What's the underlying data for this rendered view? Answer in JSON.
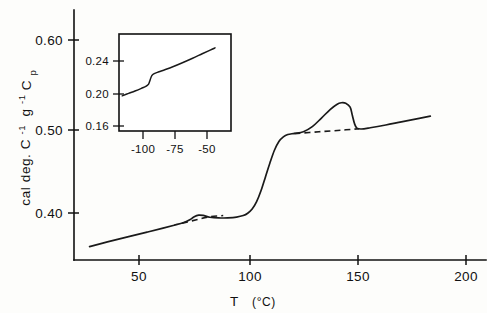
{
  "chart_data": {
    "type": "line",
    "title": "",
    "xlabel": "T  (°C)",
    "ylabel": "Cp  cal deg. C-1 g-1",
    "ylabel_parts": {
      "symbol": "C",
      "symbol_sub": "p",
      "units_a": "cal deg. C",
      "units_a_sup": "-1",
      "units_b": "g",
      "units_b_sup": "-1"
    },
    "xlabel_parts": {
      "symbol": "T",
      "units": "(°C)"
    },
    "xlim": [
      25,
      210
    ],
    "ylim": [
      0.355,
      0.625
    ],
    "grid": false,
    "legend": null,
    "xticks": [
      50,
      100,
      150,
      200
    ],
    "xtick_labels": [
      "50",
      "100",
      "150",
      "200"
    ],
    "yticks": [
      0.4,
      0.5,
      0.6
    ],
    "ytick_labels": [
      "0.40",
      "0.50",
      "0.60"
    ],
    "series": [
      {
        "name": "Cp trace",
        "style": "solid",
        "points": [
          [
            32,
            0.3695
          ],
          [
            40,
            0.3745
          ],
          [
            50,
            0.3805
          ],
          [
            58,
            0.3852
          ],
          [
            65,
            0.3895
          ],
          [
            70,
            0.3926
          ],
          [
            74,
            0.3952
          ],
          [
            77,
            0.3985
          ],
          [
            79,
            0.4018
          ],
          [
            81,
            0.4035
          ],
          [
            83,
            0.4031
          ],
          [
            86,
            0.4012
          ],
          [
            90,
            0.4004
          ],
          [
            94,
            0.4006
          ],
          [
            98,
            0.4014
          ],
          [
            101,
            0.403
          ],
          [
            103,
            0.4055
          ],
          [
            105,
            0.41
          ],
          [
            107,
            0.418
          ],
          [
            109,
            0.43
          ],
          [
            111,
            0.445
          ],
          [
            113,
            0.46
          ],
          [
            115,
            0.4735
          ],
          [
            117,
            0.483
          ],
          [
            119,
            0.488
          ],
          [
            121,
            0.4905
          ],
          [
            124,
            0.4918
          ],
          [
            128,
            0.4935
          ],
          [
            132,
            0.499
          ],
          [
            136,
            0.508
          ],
          [
            140,
            0.5175
          ],
          [
            143,
            0.523
          ],
          [
            145,
            0.5248
          ],
          [
            147,
            0.5243
          ],
          [
            149,
            0.52
          ],
          [
            150,
            0.511
          ],
          [
            151,
            0.502
          ],
          [
            152,
            0.4975
          ],
          [
            154,
            0.4965
          ],
          [
            158,
            0.4978
          ],
          [
            165,
            0.5008
          ],
          [
            172,
            0.5042
          ],
          [
            180,
            0.508
          ],
          [
            185,
            0.5103
          ]
        ]
      },
      {
        "name": "baseline under low-temperature transition",
        "style": "dashed",
        "points": [
          [
            73.5,
            0.3946
          ],
          [
            80,
            0.3985
          ],
          [
            86,
            0.4018
          ],
          [
            92,
            0.403
          ]
        ]
      },
      {
        "name": "baseline under melting endotherm",
        "style": "dashed",
        "points": [
          [
            124,
            0.4915
          ],
          [
            135,
            0.4935
          ],
          [
            145,
            0.4952
          ],
          [
            153,
            0.4968
          ]
        ]
      }
    ],
    "annotations": [
      {
        "name": "low-temperature-transition-peak",
        "x": 81,
        "y": 0.4035
      },
      {
        "name": "melting-endotherm-peak",
        "x": 145,
        "y": 0.5248
      },
      {
        "name": "glass-transition-step",
        "x": 112,
        "y": 0.45
      }
    ],
    "inset": {
      "type": "line",
      "title": "",
      "xlabel": "",
      "ylabel": "",
      "xlim": [
        -112,
        -42
      ],
      "ylim": [
        0.142,
        0.262
      ],
      "grid": false,
      "frame": "box",
      "xticks": [
        -100,
        -75,
        -50
      ],
      "xtick_labels": [
        "-100",
        "-75",
        "-50"
      ],
      "yticks": [
        0.16,
        0.2,
        0.24
      ],
      "ytick_labels": [
        "0.16",
        "0.20",
        "0.24"
      ],
      "series": [
        {
          "name": "low-temperature Cp trace",
          "style": "solid",
          "points": [
            [
              -110,
              0.1855
            ],
            [
              -106,
              0.1885
            ],
            [
              -102,
              0.1915
            ],
            [
              -98,
              0.1948
            ],
            [
              -95,
              0.1975
            ],
            [
              -93.5,
              0.2
            ],
            [
              -92.5,
              0.2055
            ],
            [
              -91.5,
              0.2105
            ],
            [
              -90,
              0.213
            ],
            [
              -87,
              0.2152
            ],
            [
              -83,
              0.218
            ],
            [
              -78,
              0.2218
            ],
            [
              -72,
              0.2268
            ],
            [
              -66,
              0.232
            ],
            [
              -60,
              0.2375
            ],
            [
              -55,
              0.242
            ],
            [
              -52,
              0.2448
            ]
          ]
        }
      ],
      "annotations": [
        {
          "name": "glass-transition-step",
          "x": -92,
          "y": 0.2055
        }
      ]
    }
  },
  "figure": {
    "background_color": "#fdfdfb",
    "line_color": "#1a1a1a",
    "axis_color": "#111111"
  }
}
